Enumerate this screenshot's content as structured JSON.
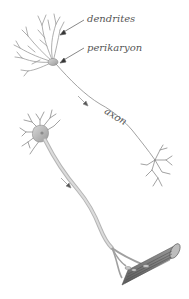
{
  "figure": {
    "labels": {
      "dendrites": "dendrites",
      "perikaryon": "perikaryon",
      "axon": "axon"
    },
    "colors": {
      "line": "#8a8a8a",
      "label": "#555555",
      "arrow": "#333333",
      "muscle": "#7a7a7a",
      "background": "#ffffff"
    }
  }
}
